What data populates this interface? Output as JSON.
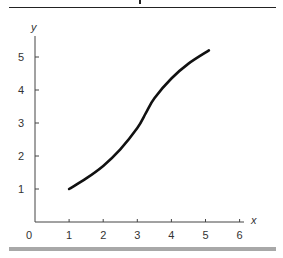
{
  "chart_data": {
    "type": "line",
    "title": "",
    "xlabel": "x",
    "ylabel": "y",
    "xlim": [
      0,
      6.3
    ],
    "ylim": [
      0,
      5.8
    ],
    "x_ticks": [
      "0",
      "1",
      "2",
      "3",
      "4",
      "5",
      "6"
    ],
    "y_ticks": [
      "1",
      "2",
      "3",
      "4",
      "5"
    ],
    "grid": false,
    "legend": null,
    "series": [
      {
        "name": "curve",
        "color": "#111111",
        "x": [
          1.0,
          1.5,
          2.0,
          2.5,
          3.0,
          3.25,
          3.5,
          4.0,
          4.5,
          5.1
        ],
        "y": [
          1.0,
          1.32,
          1.7,
          2.2,
          2.85,
          3.3,
          3.75,
          4.35,
          4.8,
          5.2
        ]
      }
    ]
  },
  "axes": {
    "origin_label": "0",
    "x_axis_label": "x",
    "y_axis_label": "y"
  }
}
